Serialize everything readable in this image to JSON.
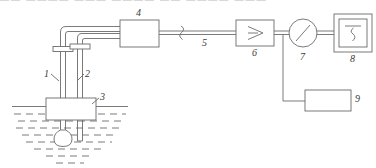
{
  "figure": {
    "type": "instrumentation-schematic",
    "title_strip": {
      "text": "▬▬ ▬▬▬▬ ▬▬▬ ▬▬▬▬ ▬▬ ▬▬▬▬ ▬▬▬",
      "note": "clipped illegible caption line at top edge"
    },
    "stroke_color": "#6b6b6b",
    "label_color": "#3a3a3a",
    "background": "#ffffff"
  },
  "labels": {
    "item1": "1",
    "item2": "2",
    "item3": "3",
    "item4": "4",
    "item5": "5",
    "item6": "6",
    "item7": "7",
    "item8": "8",
    "item9": "9"
  },
  "components": [
    {
      "id": "1",
      "name": "probe-tube-left",
      "shape": "double-line-tube"
    },
    {
      "id": "2",
      "name": "probe-tube-right",
      "shape": "double-line-tube"
    },
    {
      "id": "3",
      "name": "sensor-housing",
      "shape": "rectangle"
    },
    {
      "id": "4",
      "name": "transmitter-box",
      "shape": "rectangle"
    },
    {
      "id": "5",
      "name": "signal-cable",
      "shape": "line-with-break"
    },
    {
      "id": "6",
      "name": "amplifier",
      "shape": "rectangle-with-triangle"
    },
    {
      "id": "7",
      "name": "gauge-meter",
      "shape": "circle-with-needle"
    },
    {
      "id": "8",
      "name": "chart-recorder",
      "shape": "double-square-with-trace"
    },
    {
      "id": "9",
      "name": "power-supply",
      "shape": "rectangle"
    }
  ],
  "liquid": {
    "name": "liquid-bath",
    "surface": "solid-line",
    "fill": "dashed-rows"
  }
}
